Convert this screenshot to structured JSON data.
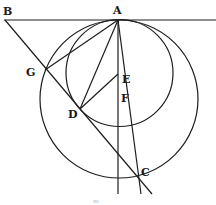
{
  "diagram": {
    "type": "geometric-construction",
    "points": {
      "A": {
        "label": "A",
        "x": 117,
        "y": 20
      },
      "B": {
        "label": "B",
        "x": 5,
        "y": 20
      },
      "G": {
        "label": "G",
        "x": 45,
        "y": 70
      },
      "D": {
        "label": "D",
        "x": 80,
        "y": 109
      },
      "E": {
        "label": "E",
        "x": 118,
        "y": 74
      },
      "F": {
        "label": "F",
        "x": 122,
        "y": 96
      },
      "C": {
        "label": "C",
        "x": 139,
        "y": 177
      }
    },
    "circles": [
      {
        "name": "large-circle",
        "cx": 119,
        "cy": 99,
        "r": 79
      },
      {
        "name": "small-circle",
        "cx": 119.5,
        "cy": 73,
        "r": 53.5
      }
    ],
    "page_mark": "m"
  }
}
